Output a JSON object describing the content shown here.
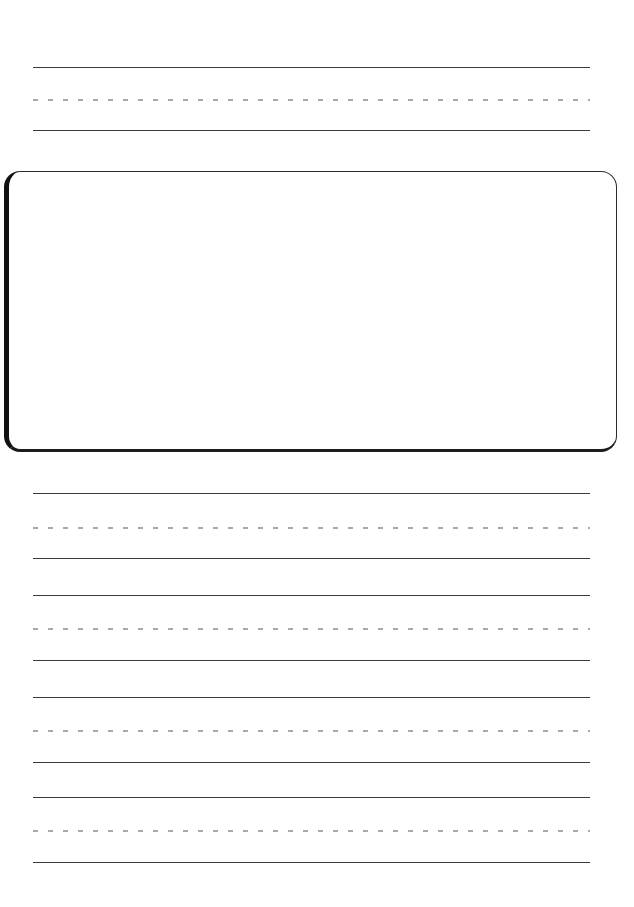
{
  "page": {
    "background_color": "#ffffff",
    "width": 634,
    "height": 907
  },
  "colors": {
    "solid_rule": "#3c3c3c",
    "dashed_rule": "#a9a9a9",
    "box_border_left": "#111111",
    "box_border_bottom": "#1c1c1c",
    "box_border_top": "#2e2e2e",
    "box_border_right": "#2b2b2b",
    "paper": "#ffffff"
  },
  "rules": {
    "left_margin": 33,
    "right_margin": 590,
    "line_width": 557,
    "dash_length": 5,
    "dash_gap": 10
  },
  "drawing_box": {
    "name": "drawing-area",
    "content": "",
    "left": 4,
    "top": 171,
    "width": 613,
    "height": 281,
    "corner_radius": 16
  },
  "guide_groups": [
    {
      "id": "group-top",
      "position": "above-drawing-box",
      "lines": [
        {
          "type": "solid",
          "role": "topline",
          "y": 67
        },
        {
          "type": "dashed",
          "role": "midline",
          "y": 99
        },
        {
          "type": "solid",
          "role": "baseline",
          "y": 130
        }
      ]
    },
    {
      "id": "group-1",
      "position": "below-drawing-box",
      "lines": [
        {
          "type": "solid",
          "role": "topline",
          "y": 493
        },
        {
          "type": "dashed",
          "role": "midline",
          "y": 527
        },
        {
          "type": "solid",
          "role": "baseline",
          "y": 558
        }
      ]
    },
    {
      "id": "group-2",
      "position": "below-drawing-box",
      "lines": [
        {
          "type": "solid",
          "role": "topline",
          "y": 595
        },
        {
          "type": "dashed",
          "role": "midline",
          "y": 628
        },
        {
          "type": "solid",
          "role": "baseline",
          "y": 660
        }
      ]
    },
    {
      "id": "group-3",
      "position": "below-drawing-box",
      "lines": [
        {
          "type": "solid",
          "role": "topline",
          "y": 697
        },
        {
          "type": "dashed",
          "role": "midline",
          "y": 730
        },
        {
          "type": "solid",
          "role": "baseline",
          "y": 762
        }
      ]
    },
    {
      "id": "group-4",
      "position": "below-drawing-box",
      "lines": [
        {
          "type": "solid",
          "role": "topline",
          "y": 797
        },
        {
          "type": "dashed",
          "role": "midline",
          "y": 830
        },
        {
          "type": "solid",
          "role": "baseline",
          "y": 862
        }
      ]
    }
  ]
}
